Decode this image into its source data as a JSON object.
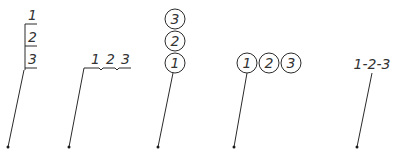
{
  "diagram": {
    "colors": {
      "line": "#2a2a2a",
      "text": "#333333",
      "background": "#ffffff"
    },
    "callouts": [
      {
        "style": "stacked-boxes",
        "labels": [
          "1",
          "2",
          "3"
        ]
      },
      {
        "style": "underline-bracketed",
        "labels": [
          "1",
          "2",
          "3"
        ]
      },
      {
        "style": "stacked-circles",
        "labels": [
          "3",
          "2",
          "1"
        ]
      },
      {
        "style": "inline-circles",
        "labels": [
          "1",
          "2",
          "3"
        ]
      },
      {
        "style": "dash-joined-text",
        "text": "1-2-3"
      }
    ]
  }
}
